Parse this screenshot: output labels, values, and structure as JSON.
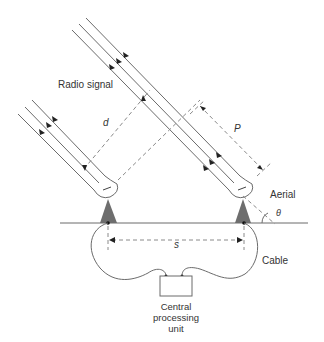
{
  "diagram": {
    "labels": {
      "radio_signal": "Radio signal",
      "d": "d",
      "p": "P",
      "aerial": "Aerial",
      "theta": "θ",
      "s": "s",
      "cable": "Cable",
      "cpu_line1": "Central",
      "cpu_line2": "processing",
      "cpu_line3": "unit"
    },
    "colors": {
      "line": "#6b6b6b",
      "dash": "#8a8a8a",
      "aerial_fill": "#6e6e6e",
      "text": "#333333"
    }
  }
}
